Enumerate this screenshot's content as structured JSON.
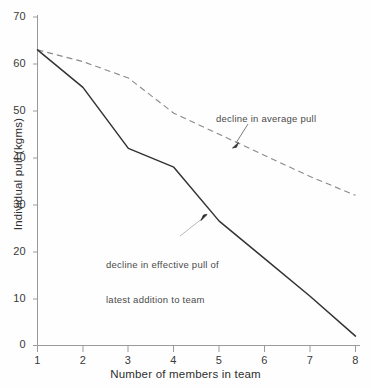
{
  "chart_data": {
    "type": "line",
    "title": "",
    "xlabel": "Number of members in team",
    "ylabel": "Individual pull (kgms)",
    "x": [
      1,
      2,
      3,
      4,
      5,
      6,
      7,
      8
    ],
    "xlim": [
      1,
      8
    ],
    "ylim": [
      0,
      70
    ],
    "xticks": [
      "1",
      "2",
      "3",
      "4",
      "5",
      "6",
      "7",
      "8"
    ],
    "yticks": [
      "0",
      "10",
      "20",
      "30",
      "40",
      "50",
      "60",
      "70"
    ],
    "grid": false,
    "legend": "none",
    "series": [
      {
        "name": "decline in effective pull of latest addition to team",
        "style": "solid",
        "color": "#333333",
        "values": [
          63,
          55,
          42,
          38,
          26.5,
          18.5,
          10.5,
          2
        ]
      },
      {
        "name": "decline in average pull",
        "style": "dashed",
        "color": "#8a8a8a",
        "values": [
          63,
          60.5,
          57,
          49.5,
          45,
          40.5,
          36,
          32
        ]
      }
    ],
    "annotations": [
      {
        "id": "average-pull",
        "text": "decline in average pull",
        "target_x": 5.0,
        "target_y": 45.5
      },
      {
        "id": "effective-pull",
        "line1": "decline in effective pull of",
        "line2": "latest addition to team",
        "target_x": 4.72,
        "target_y": 29.0
      }
    ]
  },
  "axes": {
    "y_title": "Individual pull (kgms)",
    "x_title": "Number of members in team",
    "y_tick_labels": [
      "70",
      "60",
      "50",
      "40",
      "30",
      "20",
      "10",
      "0"
    ],
    "x_tick_labels": [
      "1",
      "2",
      "3",
      "4",
      "5",
      "6",
      "7",
      "8"
    ]
  },
  "annotations": {
    "average_pull": "decline in average pull",
    "effective_pull_line1": "decline in effective pull of",
    "effective_pull_line2": "latest addition to team"
  },
  "colors": {
    "solid_line": "#333333",
    "dashed_line": "#8a8a8a",
    "axis": "#8d8d8d",
    "text": "#2e2e2e",
    "background": "#fefefe"
  }
}
